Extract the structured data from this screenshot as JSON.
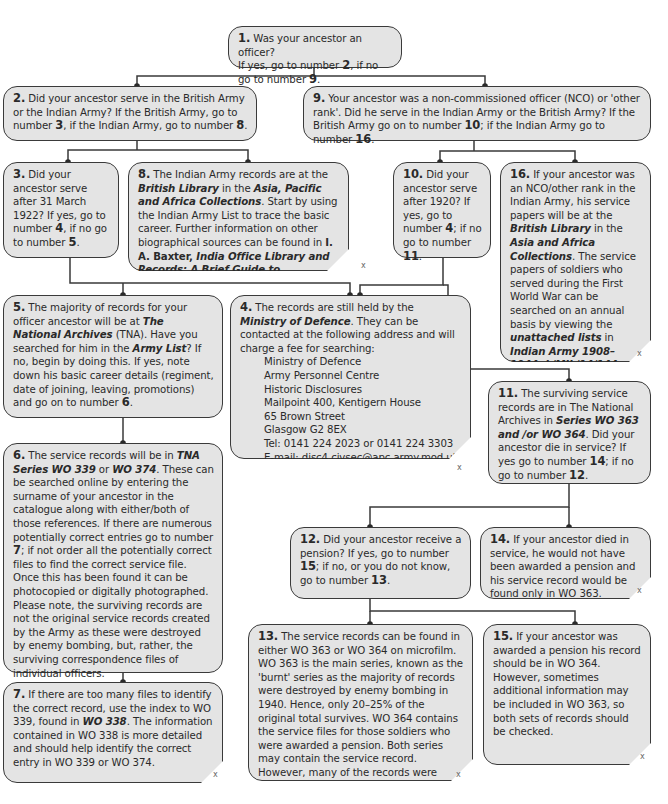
{
  "diagram": {
    "type": "flowchart",
    "topic": "Tracing a British/Indian Army ancestor's service records",
    "close_mark": "x",
    "colors": {
      "box_fill": "#e4e4e4",
      "box_border": "#3a3a3a",
      "line": "#3a3a3a",
      "background": "#ffffff"
    }
  },
  "nodes": {
    "n1": {
      "num": "1.",
      "text": "Was your ancestor an officer?",
      "line2_a": "If yes, go to number ",
      "ref_a": "2",
      "line2_b": ", if no go to number ",
      "ref_b": "9",
      "end": "."
    },
    "n2": {
      "num": "2.",
      "t1": "Did your ancestor serve in the British Army or the Indian Army? If the British Army, go to number ",
      "r1": "3",
      "t2": ", if the Indian Army, go to number ",
      "r2": "8",
      "t3": "."
    },
    "n9": {
      "num": "9.",
      "t1": "Your ancestor was a non-commissioned officer (NCO) or 'other rank'. Did he serve in the Indian Army or the British Army? If the British Army go on to number ",
      "r1": "10",
      "t2": "; if the Indian Army go to number ",
      "r2": "16",
      "t3": "."
    },
    "n3": {
      "num": "3.",
      "t1": "Did your ancestor serve after 31 March 1922? If yes, go to number ",
      "r1": "4",
      "t2": ", if no go to number ",
      "r2": "5",
      "t3": "."
    },
    "n8": {
      "num": "8.",
      "t1": "The Indian Army records are at the ",
      "b1": "British Library",
      "t2": " in the ",
      "b2": "Asia, Pacific and Africa Collections",
      "t3": ". Start by using the Indian Army List to trace the basic career. Further information on other biographical sources can be found in ",
      "b3": "I. A. Baxter, ",
      "b4": "India Office Library and Records: A Brief Guide to Biographical Sources",
      "t4": "."
    },
    "n10": {
      "num": "10.",
      "t1": "Did your ancestor serve after 1920? If yes, go to number ",
      "r1": "4",
      "t2": "; if no go to number ",
      "r2": "11",
      "t3": "."
    },
    "n16": {
      "num": "16.",
      "t1": "If your ancestor was an NCO/other rank in the Indian Army, his service papers will be at the ",
      "b1": "British Library",
      "t2": " in the ",
      "b2": "Asia and Africa Collections",
      "t3": ". The service papers of soldiers who served during the First World War can be searched on an annual basis by viewing the ",
      "b3": "unattached lists",
      "t4": " in ",
      "b4": "Indian Army 1908–1944, L/MIL/14/144–175",
      "t5": "."
    },
    "n5": {
      "num": "5.",
      "t1": "The majority of records for your officer ancestor will be at ",
      "b1": "The National Archives",
      "t2": " (TNA). Have you searched for him in the ",
      "b2": "Army List",
      "t3": "? If no, begin by doing this. If yes, note down his basic career details (regiment, date of joining, leaving, promotions) and go on to number ",
      "r1": "6",
      "t4": "."
    },
    "n4": {
      "num": "4.",
      "t1": "The records are still held by the ",
      "b1": "Ministry of Defence",
      "t2": ". They can be contacted at the following address and will charge a fee for searching:",
      "address": [
        "Ministry of Defence",
        "Army Personnel Centre",
        "Historic Disclosures",
        "Mailpoint 400, Kentigern House",
        "65 Brown Street",
        "Glasgow G2 8EX",
        "Tel: 0141 224 2023 or 0141 224 3303",
        "E-mail: disc4.civsec@apc.army.mod.uk."
      ]
    },
    "n11": {
      "num": "11.",
      "t1": "The surviving service records are in The National Archives in ",
      "b1": "Series WO 363 and /or WO 364",
      "t2": ". Did your ancestor die in service? If yes go to number ",
      "r1": "14",
      "t3": "; if no go to number ",
      "r2": "12",
      "t4": "."
    },
    "n6": {
      "num": "6.",
      "t1": "The service records will be in ",
      "b1": "TNA Series WO 339",
      "t2": " or ",
      "b2": "WO 374",
      "t3": ". These can be searched online by entering the surname of your ancestor in the catalogue along with either/both of those references. If there are numerous potentially correct entries go to number ",
      "r1": "7",
      "t4": "; if not order all the potentially correct files to find the correct service file. Once this has been found it can be photocopied or digitally photographed. Please note, the surviving records are not the original service records created by the Army as these were destroyed by enemy bombing, but, rather, the surviving correspondence files of individual officers."
    },
    "n12": {
      "num": "12.",
      "t1": "Did your ancestor receive a pension? If yes, go to number ",
      "r1": "15",
      "t2": "; if no, or you do not know, go to number ",
      "r2": "13",
      "t3": "."
    },
    "n14": {
      "num": "14.",
      "t1": "If your ancestor died in service, he would not have been awarded a pension and his service record would be found only in WO 363."
    },
    "n7": {
      "num": "7.",
      "t1": "If there are too many files to identify the correct record, use the index to WO 339, found in ",
      "b1": "WO 338",
      "t2": ". The information contained in WO 338 is more detailed and should help identify the correct entry in WO 339 or WO 374."
    },
    "n13": {
      "num": "13.",
      "t1": "The service records can be found in either WO 363 or WO 364 on microfilm. WO 363 is the main series, known as the 'burnt' series as the majority of records were destroyed by enemy bombing in 1940. Hence, only 20–25% of the original total survives. WO 364 contains the service files for those soldiers who were awarded a pension. Both series may contain the service record. However, many of the records were bombed, and there is only a 30% chance of finding a service record."
    },
    "n15": {
      "num": "15.",
      "t1": "If your ancestor was awarded a pension his record should be in WO 364. However, sometimes additional information may be included in WO 363, so both sets of records should be checked."
    }
  },
  "edges": [
    [
      "1",
      "2"
    ],
    [
      "1",
      "9"
    ],
    [
      "2",
      "3"
    ],
    [
      "2",
      "8"
    ],
    [
      "9",
      "10"
    ],
    [
      "9",
      "16"
    ],
    [
      "3",
      "5"
    ],
    [
      "3",
      "4"
    ],
    [
      "10",
      "4"
    ],
    [
      "10",
      "11"
    ],
    [
      "5",
      "6"
    ],
    [
      "6",
      "7"
    ],
    [
      "11",
      "12"
    ],
    [
      "11",
      "14"
    ],
    [
      "12",
      "13"
    ],
    [
      "12",
      "15"
    ]
  ]
}
